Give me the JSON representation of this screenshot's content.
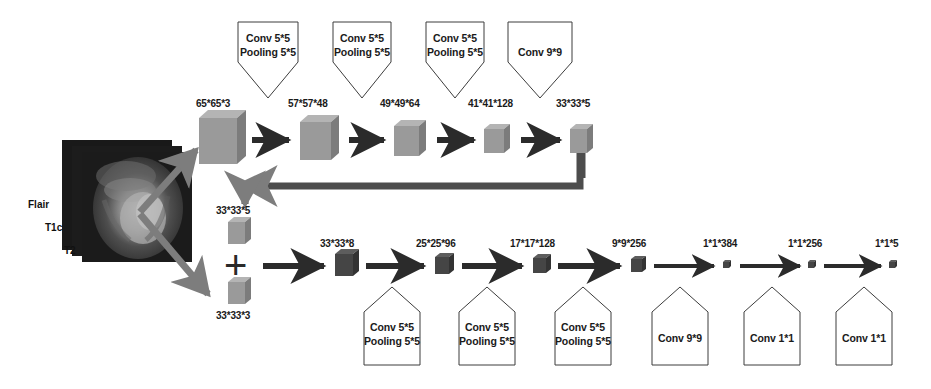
{
  "figure": {
    "type": "cnn-architecture-diagram",
    "modalities": [
      {
        "label": "Flair",
        "x": 28,
        "y": 205
      },
      {
        "label": "T1c",
        "x": 45,
        "y": 228
      },
      {
        "label": "T2",
        "x": 62,
        "y": 251
      }
    ],
    "top_path": {
      "blocks": [
        {
          "label": "65*65*3",
          "cx": 222,
          "size": 46,
          "depth": 9,
          "shade": "#9a9a9a"
        },
        {
          "label": "57*57*48",
          "cx": 318,
          "size": 38,
          "depth": 8,
          "shade": "#9a9a9a"
        },
        {
          "label": "49*49*64",
          "cx": 408,
          "size": 30,
          "depth": 7,
          "shade": "#9a9a9a"
        },
        {
          "label": "41*41*128",
          "cx": 495,
          "size": 24,
          "depth": 6,
          "shade": "#9a9a9a"
        },
        {
          "label": "33*33*5",
          "cx": 580,
          "size": 20,
          "depth": 6,
          "shade": "#9a9a9a"
        }
      ],
      "ops": [
        {
          "line1": "Conv 5*5",
          "line2": "Pooling 5*5",
          "cx": 268
        },
        {
          "line1": "Conv 5*5",
          "line2": "Pooling 5*5",
          "cx": 362
        },
        {
          "line1": "Conv 5*5",
          "line2": "Pooling 5*5",
          "cx": 455
        },
        {
          "line1": "Conv 9*9",
          "line2": "",
          "cx": 540
        }
      ]
    },
    "merge": {
      "top_input_label": "33*33*5",
      "bottom_input_label": "33*33*3",
      "plus_symbol": "+"
    },
    "bottom_path": {
      "blocks": [
        {
          "label": "33*33*8",
          "cx": 345,
          "size": 22,
          "depth": 6,
          "shade": "#4a4a4a"
        },
        {
          "label": "25*25*96",
          "cx": 443,
          "size": 17,
          "depth": 5,
          "shade": "#4a4a4a"
        },
        {
          "label": "17*17*128",
          "cx": 540,
          "size": 15,
          "depth": 5,
          "shade": "#4a4a4a"
        },
        {
          "label": "9*9*256",
          "cx": 637,
          "size": 13,
          "depth": 4,
          "shade": "#4a4a4a"
        },
        {
          "label": "1*1*384",
          "cx": 727,
          "size": 6,
          "depth": 2,
          "shade": "#4a4a4a"
        },
        {
          "label": "1*1*256",
          "cx": 812,
          "size": 6,
          "depth": 2,
          "shade": "#4a4a4a"
        },
        {
          "label": "1*1*5",
          "cx": 893,
          "size": 6,
          "depth": 2,
          "shade": "#4a4a4a"
        }
      ],
      "ops": [
        {
          "line1": "Conv 5*5",
          "line2": "Pooling 5*5",
          "cx": 392
        },
        {
          "line1": "Conv 5*5",
          "line2": "Pooling 5*5",
          "cx": 487
        },
        {
          "line1": "Conv 5*5",
          "line2": "Pooling 5*5",
          "cx": 583
        },
        {
          "line1": "Conv 9*9",
          "line2": "",
          "cx": 680
        },
        {
          "line1": "Conv 1*1",
          "line2": "",
          "cx": 772
        },
        {
          "line1": "Conv 1*1",
          "line2": "",
          "cx": 864
        }
      ]
    },
    "colors": {
      "stroke": "#3c3c3c",
      "arrow_dark": "#2b2b2b",
      "arrow_gray": "#7d7d7d",
      "cube_light": "#9a9a9a",
      "cube_dark": "#4a4a4a",
      "background": "#ffffff"
    }
  }
}
